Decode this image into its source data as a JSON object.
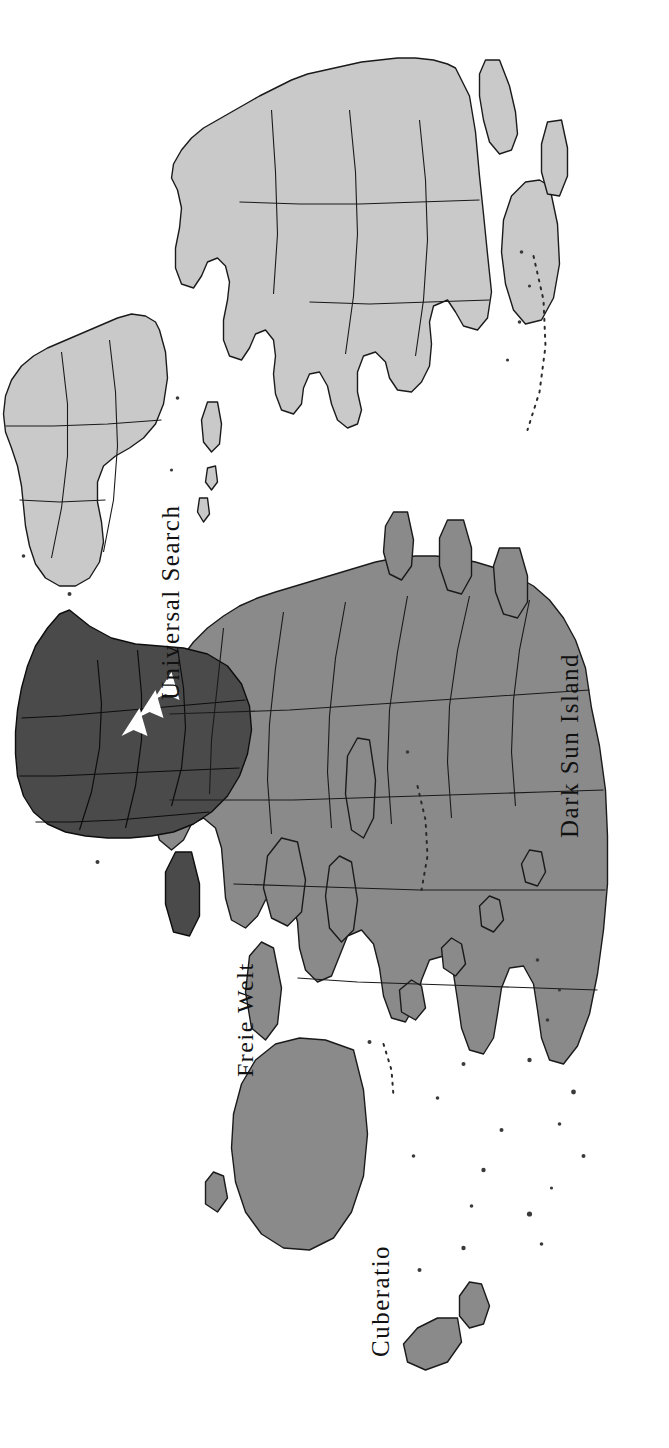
{
  "document": {
    "type": "map-image",
    "orientation": "rotated-90-clockwise",
    "background_color": "#ffffff",
    "width": 669,
    "height": 1448
  },
  "map": {
    "title": "",
    "projection": "world-outline",
    "regions": [
      {
        "id": "eurasia",
        "label": "Universal Search",
        "fill": "#8a8a8a",
        "stroke": "#1a1a1a"
      },
      {
        "id": "africa",
        "label": "Dark Sun Island",
        "fill": "#4a4a4a",
        "stroke": "#0d0d0d"
      },
      {
        "id": "north-america",
        "label": "Freie Welt",
        "fill": "#c9c9c9",
        "stroke": "#1a1a1a"
      },
      {
        "id": "south-america",
        "label": "Cuberatio",
        "fill": "#c9c9c9",
        "stroke": "#1a1a1a"
      }
    ],
    "labels": [
      {
        "name": "universal-search",
        "text": "Universal Search"
      },
      {
        "name": "dark-sun-island",
        "text": "Dark Sun Island"
      },
      {
        "name": "freie-welt",
        "text": "Freie Welt"
      },
      {
        "name": "cuberatio",
        "text": "Cuberatio"
      }
    ],
    "markers": {
      "arrow_color": "#ffffff",
      "arrow_groups": [
        {
          "name": "arrow-group-north",
          "count": 3,
          "direction": "left"
        },
        {
          "name": "arrow-group-south",
          "count": 3,
          "direction": "left"
        }
      ]
    },
    "colors": {
      "land_light": "#c9c9c9",
      "land_medium": "#8a8a8a",
      "land_dark": "#4a4a4a",
      "ocean": "#ffffff",
      "border": "#1a1a1a",
      "text": "#111111"
    }
  }
}
